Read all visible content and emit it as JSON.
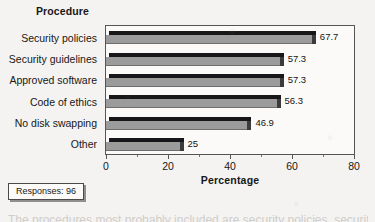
{
  "chart_data": {
    "type": "bar",
    "orientation": "horizontal",
    "title": "",
    "series_title": "Procedure",
    "categories": [
      "Security policies",
      "Security guidelines",
      "Approved software",
      "Code of ethics",
      "No disk swapping",
      "Other"
    ],
    "values": [
      67.7,
      57.3,
      57.3,
      56.3,
      46.9,
      25
    ],
    "value_labels": [
      "67.7",
      "57.3",
      "57.3",
      "56.3",
      "46.9",
      "25"
    ],
    "xlabel": "Percentage",
    "ylabel": "Procedure",
    "xlim": [
      0,
      80
    ],
    "xticks": [
      0,
      20,
      40,
      60,
      80
    ],
    "xtick_labels": [
      "0",
      "20",
      "40",
      "60",
      "80"
    ],
    "minor_tick_step": 10,
    "grid": false,
    "legend": "none",
    "bar_color": "#9b9b9b",
    "bar_top_color": "#17171a",
    "bar_cap_color": "#3b3b3e",
    "frame_color": "#555555",
    "background": "#f4f3f1"
  },
  "annotation": {
    "responses_label": "Responses: 96"
  },
  "page": {
    "cut_off_text": "The procedures most probably included are security policies, security"
  }
}
